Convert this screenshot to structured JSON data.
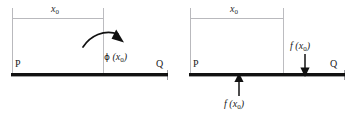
{
  "figure": {
    "title": "",
    "background_color": "#ffffff",
    "beam_color": "#111111",
    "construction_line_color": "#b9b9bd",
    "arrow_color": "#111111",
    "text_color": "#1a1a1a",
    "panels": [
      {
        "id": "left-panel",
        "name": "moment-load-diagram",
        "dimension_label": "x",
        "dimension_subscript": "0",
        "support_left_label": "P",
        "support_right_label": "Q",
        "load": {
          "type": "moment",
          "symbol": "ϕ",
          "argument_base": "x",
          "argument_subscript": "0",
          "label_prefix": "ϕ (",
          "label_suffix": ")",
          "arrow_style": "curved-clockwise"
        }
      },
      {
        "id": "right-panel",
        "name": "point-load-diagram",
        "dimension_label": "x",
        "dimension_subscript": "0",
        "support_left_label": "P",
        "support_right_label": "Q",
        "loads": [
          {
            "type": "point-force-up",
            "symbol": "f",
            "argument_base": "x",
            "argument_subscript": "0",
            "label_prefix": "f (",
            "label_suffix": ")",
            "position": "below-beam-at-x0",
            "arrow_style": "straight-up"
          },
          {
            "type": "point-force-down",
            "symbol": "f",
            "argument_base": "x",
            "argument_subscript": "0",
            "label_prefix": "f (",
            "label_suffix": ")",
            "position": "above-beam-near-Q",
            "arrow_style": "straight-down"
          }
        ]
      }
    ]
  }
}
